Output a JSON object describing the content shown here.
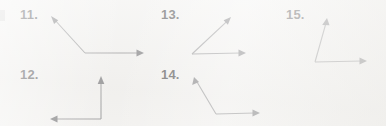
{
  "page": {
    "type": "math-worksheet-angle-figures",
    "background_color": "#f2f1ef",
    "line_color": "#8a8a8c",
    "arrowhead_color": "#6f6f72",
    "label_color": "#3a3a3c",
    "width": 386,
    "height": 126
  },
  "problems": [
    {
      "number": "11.",
      "label_x": 20,
      "label_y": 8,
      "vertex": {
        "x": 85,
        "y": 53
      },
      "rays": [
        {
          "name": "upper-left-ray",
          "tip_x": 51,
          "tip_y": 16,
          "direction": "up-left"
        },
        {
          "name": "right-ray",
          "tip_x": 144,
          "tip_y": 53,
          "direction": "right"
        }
      ],
      "angle_type": "obtuse"
    },
    {
      "number": "12.",
      "label_x": 20,
      "label_y": 68,
      "vertex": {
        "x": 101,
        "y": 119
      },
      "rays": [
        {
          "name": "up-ray",
          "tip_x": 101,
          "tip_y": 76,
          "direction": "up"
        },
        {
          "name": "left-ray",
          "tip_x": 50,
          "tip_y": 119,
          "direction": "left"
        }
      ],
      "angle_type": "right"
    },
    {
      "number": "13.",
      "label_x": 161,
      "label_y": 8,
      "vertex": {
        "x": 192,
        "y": 54
      },
      "rays": [
        {
          "name": "upper-right-ray",
          "tip_x": 231,
          "tip_y": 17,
          "direction": "up-right"
        },
        {
          "name": "right-ray",
          "tip_x": 246,
          "tip_y": 53,
          "direction": "right"
        }
      ],
      "angle_type": "acute"
    },
    {
      "number": "14.",
      "label_x": 161,
      "label_y": 68,
      "vertex": {
        "x": 216,
        "y": 114
      },
      "rays": [
        {
          "name": "upper-left-ray",
          "tip_x": 194,
          "tip_y": 77,
          "direction": "up-left"
        },
        {
          "name": "right-ray",
          "tip_x": 260,
          "tip_y": 113,
          "direction": "right"
        }
      ],
      "angle_type": "obtuse"
    },
    {
      "number": "15.",
      "label_x": 286,
      "label_y": 8,
      "vertex": {
        "x": 315,
        "y": 62
      },
      "rays": [
        {
          "name": "up-ray",
          "tip_x": 327,
          "tip_y": 18,
          "direction": "up"
        },
        {
          "name": "right-ray",
          "tip_x": 367,
          "tip_y": 61,
          "direction": "right"
        }
      ],
      "angle_type": "acute"
    }
  ]
}
